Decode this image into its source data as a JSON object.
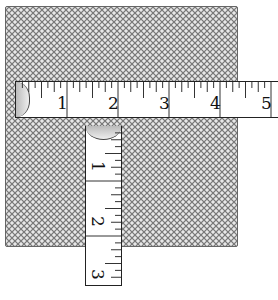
{
  "figure": {
    "mesh_color": "#7a7a7a",
    "horizontal_tape": {
      "labels": [
        "1",
        "2",
        "3",
        "4",
        "5"
      ],
      "px_per_unit": 51
    },
    "vertical_tape": {
      "labels": [
        "1",
        "2",
        "3"
      ],
      "px_per_unit": 55
    }
  }
}
